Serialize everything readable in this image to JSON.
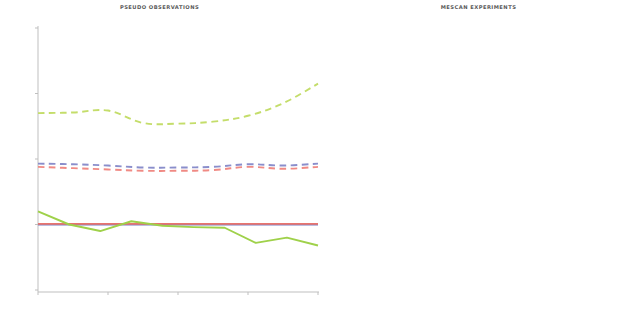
{
  "figure": {
    "width": 638,
    "height": 329,
    "background": "#ffffff"
  },
  "axis": {
    "ylabel": "°C",
    "xlabel": "Month",
    "yticks": [
      "-1",
      "0",
      "1",
      "2",
      "3"
    ],
    "xticks": [
      "oct",
      "dec",
      "feb",
      "apr",
      "jun"
    ]
  },
  "colors": {
    "alpha5": "#e8746e",
    "alphaall": "#7b7fc4",
    "astro": "#9fd14a",
    "ref": "#2b2b2b",
    "guess": "#f0c24a",
    "alpha5_dashed": "#f08a84",
    "alphaall_dashed": "#8a8ecb",
    "astro_dashed": "#c4dd6a",
    "guess_dashed": "#e8cd63",
    "axis": "#bfbfbf",
    "text": "#2b2b2b"
  },
  "left_panel": {
    "title": "PSEUDO OBSERVATIONS",
    "legend": [
      {
        "label": "Alpha5",
        "color": "#e8746e"
      },
      {
        "label": "AlphaAll",
        "color": "#7b7fc4"
      },
      {
        "label": "Astro",
        "color": "#c4dd6a"
      }
    ]
  },
  "right_panel": {
    "title": "MESCAN EXPERIMENTS",
    "legend_col1": [
      {
        "label": "Alpha5",
        "color": "#e8746e"
      },
      {
        "label": "AlphaAll",
        "color": "#7b7fc4"
      },
      {
        "label": "Astro",
        "color": "#c4dd6a"
      }
    ],
    "legend_col2": [
      {
        "label": "REF",
        "color": "#2b2b2b"
      },
      {
        "label": "GUESS",
        "color": "#e8cd63"
      }
    ]
  },
  "chart_data": {
    "type": "line",
    "xlabel": "Month",
    "ylabel": "°C",
    "ylim": [
      -1,
      3
    ],
    "xlim": [
      0,
      9
    ],
    "grid": false,
    "x": [
      "oct",
      "nov",
      "dec",
      "jan",
      "feb",
      "mar",
      "apr",
      "may",
      "jun"
    ],
    "xtick_labels": [
      "oct",
      "dec",
      "feb",
      "apr",
      "jun"
    ],
    "xtick_positions": [
      0,
      2,
      4,
      6,
      8
    ],
    "panels": [
      {
        "name": "left",
        "title": "PSEUDO OBSERVATIONS",
        "legend_position": "upper-left",
        "series": [
          {
            "name": "Astro",
            "style": "dashed",
            "color": "#c4dd6a",
            "values": [
              1.7,
              1.71,
              1.74,
              1.55,
              1.54,
              1.57,
              1.66,
              1.85,
              2.15
            ]
          },
          {
            "name": "AlphaAll",
            "style": "dashed",
            "color": "#8a8ecb",
            "values": [
              0.93,
              0.92,
              0.9,
              0.87,
              0.87,
              0.88,
              0.92,
              0.9,
              0.93
            ]
          },
          {
            "name": "Alpha5",
            "style": "dashed",
            "color": "#f08a84",
            "values": [
              0.88,
              0.86,
              0.84,
              0.82,
              0.82,
              0.83,
              0.88,
              0.85,
              0.88
            ]
          },
          {
            "name": "AlphaAll",
            "style": "solid",
            "color": "#7b7fc4",
            "values": [
              0.0,
              0.0,
              0.0,
              0.0,
              0.0,
              0.0,
              0.0,
              0.0,
              0.0
            ]
          },
          {
            "name": "Alpha5",
            "style": "solid",
            "color": "#e8746e",
            "values": [
              0.01,
              0.01,
              0.01,
              0.01,
              0.01,
              0.01,
              0.01,
              0.01,
              0.01
            ]
          },
          {
            "name": "Astro",
            "style": "solid",
            "color": "#9fd14a",
            "values": [
              0.2,
              0.0,
              -0.1,
              0.05,
              -0.02,
              -0.04,
              -0.05,
              -0.28,
              -0.2,
              -0.32
            ]
          }
        ]
      },
      {
        "name": "right",
        "title": "MESCAN EXPERIMENTS",
        "legend_position": "upper-left and upper-right",
        "series": [
          {
            "name": "GUESS",
            "style": "dashed",
            "color": "#e8cd63",
            "values": [
              2.05,
              2.04,
              2.02,
              1.98,
              1.99,
              2.05,
              2.13,
              2.25,
              2.4
            ]
          },
          {
            "name": "Astro",
            "style": "dashed",
            "color": "#c4dd6a",
            "values": [
              1.97,
              1.96,
              1.92,
              1.78,
              1.77,
              1.82,
              1.92,
              2.1,
              2.35
            ]
          },
          {
            "name": "AlphaAll",
            "style": "dashed",
            "color": "#8a8ecb",
            "values": [
              1.38,
              1.34,
              1.27,
              1.22,
              1.24,
              1.26,
              1.36,
              1.34,
              1.38
            ]
          },
          {
            "name": "Alpha5",
            "style": "dashed",
            "color": "#f08a84",
            "values": [
              1.33,
              1.29,
              1.22,
              1.18,
              1.2,
              1.22,
              1.33,
              1.3,
              1.34
            ]
          },
          {
            "name": "REF",
            "style": "dashed",
            "color": "#2b2b2b",
            "values": [
              1.22,
              1.17,
              1.1,
              1.06,
              1.08,
              1.1,
              1.2,
              1.17,
              1.2
            ]
          },
          {
            "name": "REF",
            "style": "solid",
            "color": "#2b2b2b",
            "values": [
              0.1,
              0.1,
              0.1,
              0.1,
              0.1,
              0.1,
              0.1,
              0.1,
              0.1
            ]
          },
          {
            "name": "AlphaAll",
            "style": "solid",
            "color": "#7b7fc4",
            "values": [
              0.1,
              0.1,
              0.1,
              0.1,
              0.1,
              0.1,
              0.1,
              0.1,
              0.1
            ]
          },
          {
            "name": "Astro",
            "style": "solid",
            "color": "#9fd14a",
            "values": [
              0.3,
              0.14,
              0.0,
              0.12,
              0.05,
              0.05,
              0.05,
              -0.22,
              -0.22,
              -0.3
            ]
          },
          {
            "name": "GUESS",
            "style": "solid",
            "color": "#f0c24a",
            "values": [
              -0.4,
              -0.88,
              -0.88,
              -0.72,
              -0.8,
              -0.7,
              -0.45,
              -0.58,
              -0.6
            ]
          }
        ]
      }
    ]
  }
}
